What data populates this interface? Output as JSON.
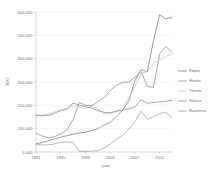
{
  "chart_data": {
    "type": "line",
    "title": "",
    "xlabel": "year",
    "ylabel": "TEU",
    "xlim": [
      1991,
      2013
    ],
    "ylim": [
      0,
      600000
    ],
    "grid": true,
    "legend_position": "right",
    "x": [
      1991,
      1992,
      1993,
      1994,
      1995,
      1996,
      1997,
      1998,
      1999,
      2000,
      2001,
      2002,
      2003,
      2004,
      2005,
      2006,
      2007,
      2008,
      2009,
      2010,
      2011,
      2012,
      2013
    ],
    "xticks": [
      1991,
      1995,
      1999,
      2003,
      2007,
      2011
    ],
    "xtick_labels": [
      "1991",
      "1995",
      "1999",
      "2003",
      "2007",
      "2011"
    ],
    "yticks": [
      0,
      100000,
      200000,
      300000,
      400000,
      500000,
      600000
    ],
    "ytick_labels": [
      "0,000",
      "100,000",
      "200,000",
      "300,000",
      "400,000",
      "500,000",
      "600,000"
    ],
    "series": [
      {
        "name": "Koper",
        "color": "#7a7a7a",
        "values": [
          35000,
          41000,
          48000,
          56000,
          63000,
          70000,
          76000,
          81000,
          85000,
          92000,
          100000,
          115000,
          126000,
          153000,
          180000,
          218000,
          305000,
          353000,
          343000,
          476000,
          589000,
          570000,
          578000
        ]
      },
      {
        "name": "Rijeka",
        "color": "#8c8c8c",
        "values": [
          80000,
          68000,
          61000,
          66000,
          77000,
          94000,
          140000,
          212000,
          200000,
          198000,
          215000,
          233000,
          263000,
          286000,
          298000,
          300000,
          320000,
          345000,
          282000,
          276000,
          420000,
          452000,
          428000
        ]
      },
      {
        "name": "Trieste",
        "color": "#c6c6c6",
        "values": [
          155000,
          159000,
          163000,
          172000,
          180000,
          183000,
          199000,
          192000,
          187000,
          195000,
          185000,
          163000,
          164000,
          172000,
          195000,
          230000,
          280000,
          335000,
          345000,
          380000,
          395000,
          410000,
          420000
        ]
      },
      {
        "name": "Venice",
        "color": "#8a8a8a",
        "values": [
          158000,
          155000,
          156000,
          166000,
          178000,
          185000,
          210000,
          200000,
          195000,
          188000,
          178000,
          170000,
          168000,
          175000,
          180000,
          186000,
          192000,
          225000,
          209000,
          212000,
          215000,
          218000,
          222000
        ]
      },
      {
        "name": "Ravenna",
        "color": "#9d9d9d",
        "values": [
          33000,
          30000,
          31000,
          35000,
          42000,
          42000,
          42000,
          3000,
          3000,
          4000,
          6000,
          18000,
          33000,
          55000,
          72000,
          98000,
          130000,
          175000,
          140000,
          152000,
          165000,
          170000,
          148000
        ]
      }
    ]
  },
  "axes": {
    "y_title": "TEU",
    "x_title": "year"
  }
}
